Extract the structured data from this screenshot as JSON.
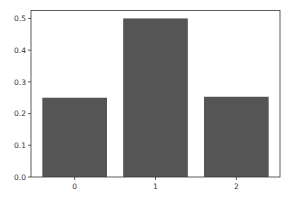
{
  "chart_data": {
    "type": "bar",
    "title": "",
    "xlabel": "",
    "ylabel": "",
    "categories": [
      "0",
      "1",
      "2"
    ],
    "values": [
      0.25,
      0.5,
      0.253
    ],
    "ylim": [
      0,
      0.525
    ],
    "yticks": [
      "0.0",
      "0.1",
      "0.2",
      "0.3",
      "0.4",
      "0.5"
    ],
    "ytick_values": [
      0,
      0.1,
      0.2,
      0.3,
      0.4,
      0.5
    ],
    "grid": false,
    "legend": null,
    "bar_color": "#555555"
  }
}
